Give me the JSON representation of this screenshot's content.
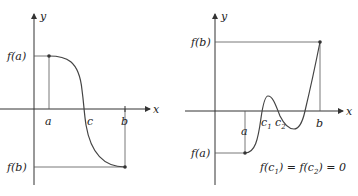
{
  "figures": [
    {
      "id": "left",
      "description": "Decreasing function from f(a) to f(b) crossing x-axis at c",
      "axis_labels": {
        "x": "x",
        "y": "y"
      },
      "x_labels": {
        "a": "a",
        "c": "c",
        "b": "b"
      },
      "y_labels": {
        "fa": "f(a)",
        "fb": "f(b)"
      }
    },
    {
      "id": "right",
      "description": "Increasing function from f(a) to f(b) crossing x-axis at c1, c2, and a third point",
      "axis_labels": {
        "x": "x",
        "y": "y"
      },
      "x_labels": {
        "a": "a",
        "c1_base": "c",
        "c1_sub": "1",
        "c2_base": "c",
        "c2_sub": "2",
        "b": "b"
      },
      "y_labels": {
        "fa": "f(a)",
        "fb": "f(b)"
      },
      "equation": {
        "p1": "f(c",
        "s1": "1",
        "p2": ") = f(c",
        "s2": "2",
        "p3": ") = 0"
      }
    }
  ],
  "colors": {
    "ink": "#333333",
    "background": "#ffffff"
  }
}
